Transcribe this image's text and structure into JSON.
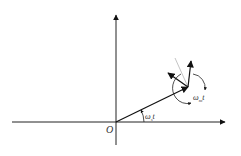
{
  "diagram": {
    "type": "rotating-vector-diagram",
    "origin_label": "O",
    "angle_label_base": {
      "symbol": "ω",
      "sub": "s",
      "tail": "t"
    },
    "angle_label_rotor": {
      "symbol": "ω",
      "sub": "m",
      "tail": "t"
    },
    "colors": {
      "stroke": "#111111",
      "thin": "#999999",
      "text": "#333333"
    }
  }
}
